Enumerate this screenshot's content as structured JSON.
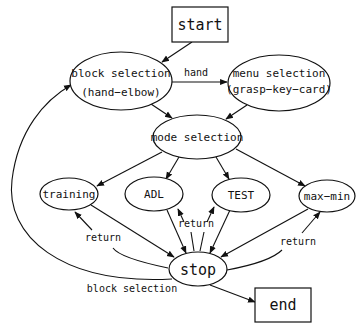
{
  "diagram": {
    "type": "state-transition flowchart",
    "nodes": {
      "start": {
        "label": "start",
        "shape": "rectangle"
      },
      "block_selection": {
        "label": "block selection",
        "sublabel": "(hand−elbow)",
        "shape": "ellipse"
      },
      "menu_selection": {
        "label": "menu selection",
        "sublabel": "(grasp−key−card)",
        "shape": "ellipse"
      },
      "mode_selection": {
        "label": "mode selection",
        "shape": "ellipse"
      },
      "training": {
        "label": "training",
        "shape": "ellipse"
      },
      "adl": {
        "label": "ADL",
        "shape": "ellipse"
      },
      "test": {
        "label": "TEST",
        "shape": "ellipse"
      },
      "max_min": {
        "label": "max−min",
        "shape": "ellipse"
      },
      "stop": {
        "label": "stop",
        "shape": "ellipse"
      },
      "end": {
        "label": "end",
        "shape": "rectangle"
      }
    },
    "edge_labels": {
      "hand": "hand",
      "return_left": "return",
      "return_center": "return",
      "return_right": "return",
      "block_selection_loop": "block selection"
    },
    "edges": [
      {
        "from": "start",
        "to": "block_selection",
        "label": ""
      },
      {
        "from": "block_selection",
        "to": "menu_selection",
        "label": "hand"
      },
      {
        "from": "block_selection",
        "to": "mode_selection",
        "label": ""
      },
      {
        "from": "menu_selection",
        "to": "mode_selection",
        "label": ""
      },
      {
        "from": "mode_selection",
        "to": "training",
        "label": ""
      },
      {
        "from": "mode_selection",
        "to": "adl",
        "label": ""
      },
      {
        "from": "mode_selection",
        "to": "test",
        "label": ""
      },
      {
        "from": "mode_selection",
        "to": "max_min",
        "label": ""
      },
      {
        "from": "training",
        "to": "stop",
        "label": ""
      },
      {
        "from": "adl",
        "to": "stop",
        "label": ""
      },
      {
        "from": "test",
        "to": "stop",
        "label": ""
      },
      {
        "from": "max_min",
        "to": "stop",
        "label": ""
      },
      {
        "from": "stop",
        "to": "training",
        "label": "return"
      },
      {
        "from": "stop",
        "to": "adl",
        "label": "return"
      },
      {
        "from": "stop",
        "to": "test",
        "label": "return"
      },
      {
        "from": "stop",
        "to": "max_min",
        "label": "return"
      },
      {
        "from": "stop",
        "to": "block_selection",
        "label": "block selection"
      },
      {
        "from": "stop",
        "to": "end",
        "label": ""
      }
    ],
    "colors": {
      "stroke": "#111111",
      "background": "#ffffff"
    }
  }
}
